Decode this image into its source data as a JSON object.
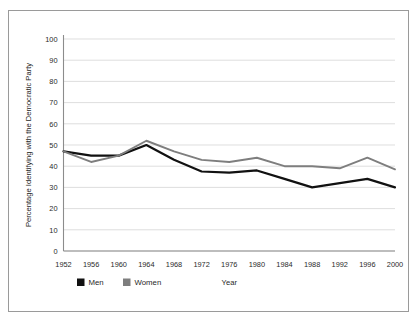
{
  "chart_data": {
    "type": "line",
    "title": "",
    "xlabel": "Year",
    "ylabel": "Percentage Identifying with the Democratic Party",
    "categories": [
      "1952",
      "1956",
      "1960",
      "1964",
      "1968",
      "1972",
      "1976",
      "1980",
      "1984",
      "1988",
      "1992",
      "1996",
      "2000"
    ],
    "x": [
      1952,
      1956,
      1960,
      1964,
      1968,
      1972,
      1976,
      1980,
      1984,
      1988,
      1992,
      1996,
      2000
    ],
    "ylim": [
      0,
      100
    ],
    "yticks": [
      0,
      10,
      20,
      30,
      40,
      50,
      60,
      70,
      80,
      90,
      100
    ],
    "ytick_labels": [
      "0",
      "10",
      "20",
      "30",
      "40",
      "50",
      "60",
      "70",
      "80",
      "90",
      "100"
    ],
    "grid": true,
    "legend_position": "bottom-left",
    "series": [
      {
        "name": "Men",
        "color": "#111111",
        "values": [
          47,
          45,
          45,
          50,
          43,
          37.5,
          37,
          38,
          34,
          30,
          32,
          34,
          30
        ]
      },
      {
        "name": "Women",
        "color": "#7e7e7e",
        "values": [
          47,
          42,
          45,
          52,
          47,
          43,
          42,
          44,
          40,
          40,
          39,
          44,
          38.5
        ]
      }
    ]
  },
  "legend": {
    "items": [
      {
        "label": "Men",
        "color": "#111111"
      },
      {
        "label": "Women",
        "color": "#7e7e7e"
      }
    ]
  },
  "axes": {
    "x_title": "Year",
    "y_title": "Percentage Identifying with the Democratic Party"
  },
  "colors": {
    "men": "#111111",
    "women": "#7e7e7e",
    "grid": "#d0d0d0",
    "axis": "#8c8c8c",
    "frame_border": "#9a9a9a",
    "background": "#ffffff"
  }
}
